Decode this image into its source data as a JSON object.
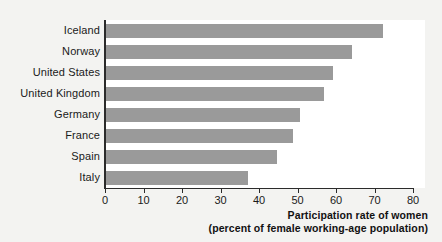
{
  "chart_data": {
    "type": "bar",
    "orientation": "horizontal",
    "title": "",
    "subtitle": "",
    "categories": [
      "Iceland",
      "Norway",
      "United States",
      "United Kingdom",
      "Germany",
      "France",
      "Spain",
      "Italy"
    ],
    "values": [
      72,
      64,
      59,
      56.5,
      50.5,
      48.5,
      44.5,
      37
    ],
    "series": [
      {
        "name": "Participation rate of women",
        "values": [
          72,
          64,
          59,
          56.5,
          50.5,
          48.5,
          44.5,
          37
        ]
      }
    ],
    "xlabel": "Participation rate of women",
    "xlabel_line2": "(percent of female working-age population)",
    "ylabel": "",
    "xlim": [
      0,
      80
    ],
    "xticks": [
      0,
      10,
      20,
      30,
      40,
      50,
      60,
      70,
      80
    ],
    "xtick_labels": [
      "0",
      "10",
      "20",
      "30",
      "40",
      "50",
      "60",
      "70",
      "80"
    ],
    "grid": false,
    "legend": false,
    "legend_position": "none",
    "bar_color": "#9a9a9a",
    "plot_background": "#ffffff",
    "figure_background": "#f3f3f1",
    "axis_color": "#2b2b2b",
    "text_color": "#1a1a1a"
  }
}
